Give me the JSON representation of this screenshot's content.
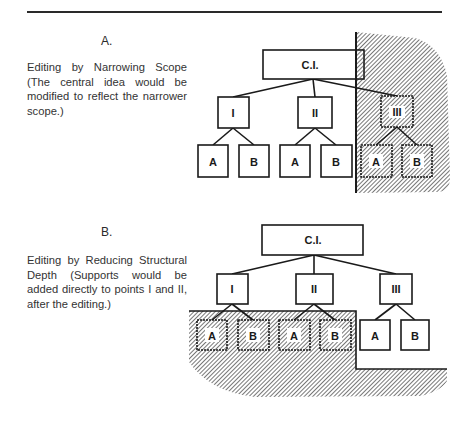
{
  "figure": {
    "section_a": {
      "label": "A.",
      "caption": "Editing by Narrowing Scope (The central idea would be modified to reflect the narrower scope.)",
      "tree": {
        "root": "C.I.",
        "branches": [
          {
            "label": "I",
            "children": [
              "A",
              "B"
            ],
            "removed": false
          },
          {
            "label": "II",
            "children": [
              "A",
              "B"
            ],
            "removed": false
          },
          {
            "label": "III",
            "children": [
              "A",
              "B"
            ],
            "removed": true
          }
        ]
      },
      "shaded_region": "branch III and its supports"
    },
    "section_b": {
      "label": "B.",
      "caption": "Editing by Reducing Structural Depth (Supports would be added directly to points I and II, after the editing.)",
      "tree": {
        "root": "C.I.",
        "branches": [
          {
            "label": "I",
            "children": [
              "A",
              "B"
            ],
            "children_removed": true
          },
          {
            "label": "II",
            "children": [
              "A",
              "B"
            ],
            "children_removed": true
          },
          {
            "label": "III",
            "children": [
              "A",
              "B"
            ],
            "children_removed": false
          }
        ]
      },
      "shaded_region": "supports under I and II"
    }
  },
  "labels": {
    "a_root": "C.I.",
    "a_b1": "I",
    "a_b2": "II",
    "a_b3": "III",
    "a_b1_c1": "A",
    "a_b1_c2": "B",
    "a_b2_c1": "A",
    "a_b2_c2": "B",
    "a_b3_c1": "A",
    "a_b3_c2": "B",
    "b_root": "C.I.",
    "b_b1": "I",
    "b_b2": "II",
    "b_b3": "III",
    "b_b1_c1": "A",
    "b_b1_c2": "B",
    "b_b2_c1": "A",
    "b_b2_c2": "B",
    "b_b3_c1": "A",
    "b_b3_c2": "B"
  },
  "colors": {
    "ink": "#1a1a1a",
    "hatch": "#555555",
    "paper": "#ffffff"
  }
}
